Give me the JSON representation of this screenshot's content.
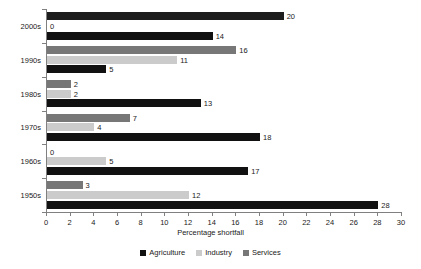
{
  "chart_data": {
    "type": "bar",
    "orientation": "horizontal",
    "grouped": true,
    "title": "",
    "xlabel": "Percentage shortfall",
    "ylabel": "",
    "xlim": [
      0,
      30
    ],
    "xticks": [
      0,
      2,
      4,
      6,
      8,
      10,
      12,
      14,
      16,
      18,
      20,
      22,
      24,
      26,
      28,
      30
    ],
    "grid": false,
    "legend_position": "bottom",
    "categories": [
      "2000s",
      "1990s",
      "1980s",
      "1970s",
      "1960s",
      "1950s"
    ],
    "series": [
      {
        "name": "Agriculture",
        "color": "#111111",
        "values": [
          14,
          5,
          13,
          18,
          17,
          28
        ]
      },
      {
        "name": "Industry",
        "color": "#cbcbcb",
        "values": [
          0,
          11,
          2,
          4,
          5,
          12
        ]
      },
      {
        "name": "Services",
        "color": "#777777",
        "values": [
          20,
          16,
          2,
          7,
          0,
          3
        ]
      }
    ],
    "bar_labels": {
      "2000s": {
        "Services": "20",
        "Industry": "0",
        "Agriculture": "14"
      },
      "1990s": {
        "Services": "16",
        "Industry": "11",
        "Agriculture": "5"
      },
      "1980s": {
        "Services": "2",
        "Industry": "2",
        "Agriculture": "13"
      },
      "1970s": {
        "Services": "7",
        "Industry": "4",
        "Agriculture": "18"
      },
      "1960s": {
        "Services": "0",
        "Industry": "5",
        "Agriculture": "17"
      },
      "1950s": {
        "Services": "3",
        "Industry": "12",
        "Agriculture": "28"
      }
    }
  },
  "axis": {
    "x_title": "Percentage shortfall",
    "tick_labels": [
      "0",
      "2",
      "4",
      "6",
      "8",
      "10",
      "12",
      "14",
      "16",
      "18",
      "20",
      "22",
      "24",
      "26",
      "28",
      "30"
    ],
    "category_labels": [
      "2000s",
      "1990s",
      "1980s",
      "1970s",
      "1960s",
      "1950s"
    ]
  },
  "legend": {
    "items": [
      {
        "label": "Agriculture",
        "color": "#111111"
      },
      {
        "label": "Industry",
        "color": "#cbcbcb"
      },
      {
        "label": "Services",
        "color": "#777777"
      }
    ]
  }
}
